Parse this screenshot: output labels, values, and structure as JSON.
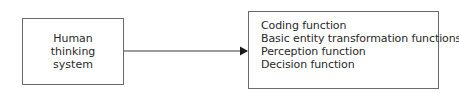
{
  "diagram": {
    "source_node": {
      "lines": [
        "Human",
        "thinking",
        "system"
      ]
    },
    "target_node": {
      "items": [
        "Coding function",
        "Basic entity transformation functions",
        "Perception function",
        "Decision function"
      ]
    },
    "edge": {
      "from": "source_node",
      "to": "target_node",
      "style": "arrow"
    },
    "colors": {
      "stroke": "#6b6b6b",
      "arrow": "#1a1a1a",
      "text": "#2a2a2a"
    }
  }
}
